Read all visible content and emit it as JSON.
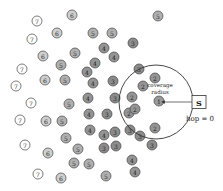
{
  "diagram": {
    "annotation": {
      "coverage_line1": "coverage",
      "coverage_line2": "radius",
      "hop_label": "hop = 0"
    },
    "sink": {
      "label": "S",
      "x": 199,
      "y": 102,
      "w": 14,
      "h": 13
    },
    "coverage_circle": {
      "cx": 156,
      "cy": 102,
      "r": 37
    },
    "arrow": {
      "x1": 192,
      "y1": 102,
      "x2": 162,
      "y2": 102
    },
    "hop_colors": {
      "1": "#9a9a9a",
      "2": "#959595",
      "3": "#8c8c8c",
      "4": "#949494",
      "5": "#b0b0b0",
      "6": "#cfcfcf",
      "7": "#ffffff"
    },
    "nodes": [
      {
        "x": 72,
        "y": 15,
        "hop": "6"
      },
      {
        "x": 37,
        "y": 21,
        "hop": "7"
      },
      {
        "x": 158,
        "y": 16,
        "hop": "5"
      },
      {
        "x": 57,
        "y": 33,
        "hop": "6"
      },
      {
        "x": 93,
        "y": 33,
        "hop": "5"
      },
      {
        "x": 112,
        "y": 33,
        "hop": "5"
      },
      {
        "x": 32,
        "y": 39,
        "hop": "7"
      },
      {
        "x": 133,
        "y": 43,
        "hop": "3"
      },
      {
        "x": 104,
        "y": 48,
        "hop": "4"
      },
      {
        "x": 75,
        "y": 53,
        "hop": "5"
      },
      {
        "x": 43,
        "y": 56,
        "hop": "6"
      },
      {
        "x": 114,
        "y": 57,
        "hop": "4"
      },
      {
        "x": 61,
        "y": 65,
        "hop": "5"
      },
      {
        "x": 95,
        "y": 63,
        "hop": "4"
      },
      {
        "x": 22,
        "y": 69,
        "hop": "7"
      },
      {
        "x": 87,
        "y": 72,
        "hop": "4"
      },
      {
        "x": 139,
        "y": 69,
        "hop": "3"
      },
      {
        "x": 155,
        "y": 78,
        "hop": "2"
      },
      {
        "x": 16,
        "y": 86,
        "hop": "7"
      },
      {
        "x": 45,
        "y": 80,
        "hop": "6"
      },
      {
        "x": 65,
        "y": 80,
        "hop": "5"
      },
      {
        "x": 93,
        "y": 83,
        "hop": "4"
      },
      {
        "x": 113,
        "y": 81,
        "hop": "3"
      },
      {
        "x": 143,
        "y": 86,
        "hop": "2"
      },
      {
        "x": 31,
        "y": 103,
        "hop": "7"
      },
      {
        "x": 69,
        "y": 104,
        "hop": "5"
      },
      {
        "x": 88,
        "y": 98,
        "hop": "4"
      },
      {
        "x": 115,
        "y": 98,
        "hop": "3"
      },
      {
        "x": 132,
        "y": 97,
        "hop": "2"
      },
      {
        "x": 159,
        "y": 101,
        "hop": "1"
      },
      {
        "x": 20,
        "y": 120,
        "hop": "7"
      },
      {
        "x": 46,
        "y": 121,
        "hop": "6"
      },
      {
        "x": 62,
        "y": 121,
        "hop": "5"
      },
      {
        "x": 89,
        "y": 114,
        "hop": "4"
      },
      {
        "x": 107,
        "y": 114,
        "hop": "3"
      },
      {
        "x": 129,
        "y": 113,
        "hop": "2"
      },
      {
        "x": 135,
        "y": 109,
        "hop": "2"
      },
      {
        "x": 90,
        "y": 130,
        "hop": "4"
      },
      {
        "x": 104,
        "y": 135,
        "hop": "4"
      },
      {
        "x": 115,
        "y": 132,
        "hop": "3"
      },
      {
        "x": 130,
        "y": 130,
        "hop": "3"
      },
      {
        "x": 155,
        "y": 128,
        "hop": "2"
      },
      {
        "x": 25,
        "y": 145,
        "hop": "7"
      },
      {
        "x": 48,
        "y": 153,
        "hop": "6"
      },
      {
        "x": 66,
        "y": 138,
        "hop": "5"
      },
      {
        "x": 78,
        "y": 149,
        "hop": "5"
      },
      {
        "x": 104,
        "y": 148,
        "hop": "3"
      },
      {
        "x": 116,
        "y": 146,
        "hop": "3"
      },
      {
        "x": 140,
        "y": 136,
        "hop": "3"
      },
      {
        "x": 152,
        "y": 145,
        "hop": "3"
      },
      {
        "x": 74,
        "y": 163,
        "hop": "5"
      },
      {
        "x": 89,
        "y": 164,
        "hop": "5"
      },
      {
        "x": 132,
        "y": 160,
        "hop": "4"
      },
      {
        "x": 38,
        "y": 174,
        "hop": "7"
      },
      {
        "x": 61,
        "y": 178,
        "hop": "6"
      },
      {
        "x": 106,
        "y": 176,
        "hop": "5"
      },
      {
        "x": 135,
        "y": 172,
        "hop": "4"
      }
    ]
  }
}
